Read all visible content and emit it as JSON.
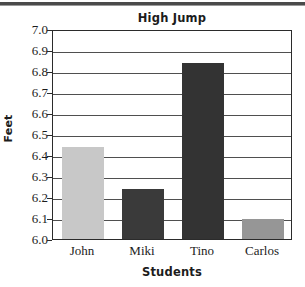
{
  "chart_data": {
    "type": "bar",
    "title": "High Jump",
    "xlabel": "Students",
    "ylabel": "Feet",
    "categories": [
      "John",
      "Miki",
      "Tino",
      "Carlos"
    ],
    "values": [
      6.44,
      6.24,
      6.84,
      6.095
    ],
    "bar_colors": [
      "#c8c8c8",
      "#3a3a3a",
      "#333333",
      "#969696"
    ],
    "ylim": [
      6.0,
      7.0
    ],
    "ytick_labels": [
      "7.0",
      "6.9",
      "6.8",
      "6.7",
      "6.6",
      "6.5",
      "6.4",
      "6.3",
      "6.2",
      "6.1",
      "6.0"
    ],
    "ytick_values": [
      7.0,
      6.9,
      6.8,
      6.7,
      6.6,
      6.5,
      6.4,
      6.3,
      6.2,
      6.1,
      6.0
    ],
    "grid": true,
    "legend": null,
    "frame_color": "#2b2b2b",
    "gridline_color": "#4f4f4f",
    "background": "#ffffff"
  }
}
